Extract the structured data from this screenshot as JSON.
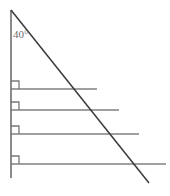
{
  "figure": {
    "kind": "geometry-diagram",
    "background_color": "#ffffff",
    "angle_label": {
      "value": "40",
      "unit_symbol": "°",
      "text": "40°",
      "color": "#6e6e6e",
      "x": 13,
      "y": 29
    },
    "vertical_line": {
      "name": "vertical-line",
      "x1": 11,
      "y1": 10,
      "x2": 11,
      "y2": 178,
      "color": "#6f6f6f",
      "width": 1.6
    },
    "diagonal_line": {
      "name": "diagonal-line",
      "x1": 11,
      "y1": 10,
      "x2": 149,
      "y2": 183,
      "color": "#3a3a3a",
      "width": 1.5
    },
    "horizontal_lines": [
      {
        "name": "horizontal-line-1",
        "x1": 11,
        "y1": 89,
        "x2": 97,
        "y2": 89,
        "color": "#808080",
        "width": 1.4
      },
      {
        "name": "horizontal-line-2",
        "x1": 11,
        "y1": 110,
        "x2": 119,
        "y2": 110,
        "color": "#808080",
        "width": 1.4
      },
      {
        "name": "horizontal-line-3",
        "x1": 11,
        "y1": 134,
        "x2": 139,
        "y2": 134,
        "color": "#808080",
        "width": 1.4
      },
      {
        "name": "horizontal-line-4",
        "x1": 11,
        "y1": 164,
        "x2": 166,
        "y2": 164,
        "color": "#808080",
        "width": 1.4
      }
    ],
    "right_angle_markers": [
      {
        "name": "right-angle-marker-1",
        "x": 11,
        "y": 89,
        "size": 8,
        "color": "#7a7a7a",
        "width": 1.3
      },
      {
        "name": "right-angle-marker-2",
        "x": 11,
        "y": 110,
        "size": 8,
        "color": "#7a7a7a",
        "width": 1.3
      },
      {
        "name": "right-angle-marker-3",
        "x": 11,
        "y": 134,
        "size": 8,
        "color": "#7a7a7a",
        "width": 1.3
      },
      {
        "name": "right-angle-marker-4",
        "x": 11,
        "y": 164,
        "size": 8,
        "color": "#7a7a7a",
        "width": 1.3
      }
    ]
  }
}
